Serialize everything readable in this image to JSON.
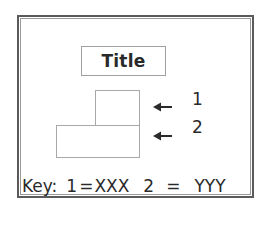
{
  "diagram": {
    "title": "Title",
    "blocks": [
      {
        "id": 1,
        "label": "1"
      },
      {
        "id": 2,
        "label": "2"
      }
    ],
    "arrows": [
      {
        "icon": "arrow-left-icon",
        "points_to": "1"
      },
      {
        "icon": "arrow-left-icon",
        "points_to": "2"
      }
    ],
    "key": {
      "label": "Key:",
      "entries": [
        {
          "number": "1",
          "equals": "=",
          "value": "XXX"
        },
        {
          "number": "2",
          "equals": "=",
          "value": "YYY"
        }
      ]
    }
  },
  "colors": {
    "frame_outer": "#5a5a5a",
    "frame_inner": "#9a9a9a",
    "box_border": "#a8a8a8",
    "text": "#2a2a2a",
    "background": "#ffffff"
  }
}
